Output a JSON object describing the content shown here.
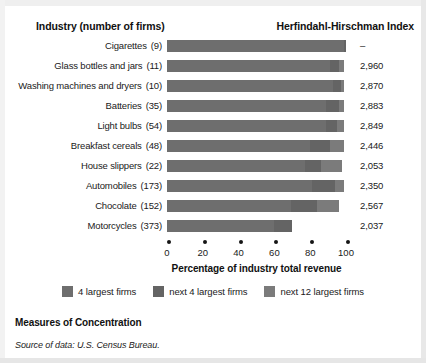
{
  "header": {
    "industry_label": "Industry (number of firms)",
    "hhi_label": "Herfindahl-Hirschman Index"
  },
  "footer": {
    "title": "Measures of Concentration",
    "source": "Source of data: U.S. Census Bureau."
  },
  "axis": {
    "title": "Percentage of industry total revenue",
    "ticks": [
      "0",
      "20",
      "40",
      "60",
      "80",
      "100"
    ]
  },
  "legend": [
    {
      "label": "4 largest firms",
      "color": "#6e6e6e"
    },
    {
      "label": "next 4 largest firms",
      "color": "#646464"
    },
    {
      "label": "next 12 largest firms",
      "color": "#7b7b7b"
    }
  ],
  "rows": [
    {
      "industry": "Cigarettes",
      "firms": "(9)",
      "hhi": "–"
    },
    {
      "industry": "Glass bottles and jars",
      "firms": "(11)",
      "hhi": "2,960"
    },
    {
      "industry": "Washing machines and dryers",
      "firms": "(10)",
      "hhi": "2,870"
    },
    {
      "industry": "Batteries",
      "firms": "(35)",
      "hhi": "2,883"
    },
    {
      "industry": "Light bulbs",
      "firms": "(54)",
      "hhi": "2,849"
    },
    {
      "industry": "Breakfast cereals",
      "firms": "(48)",
      "hhi": "2,446"
    },
    {
      "industry": "House slippers",
      "firms": "(22)",
      "hhi": "2,053"
    },
    {
      "industry": "Automobiles",
      "firms": "(173)",
      "hhi": "2,350"
    },
    {
      "industry": "Chocolate",
      "firms": "(152)",
      "hhi": "2,567"
    },
    {
      "industry": "Motorcycles",
      "firms": "(373)",
      "hhi": "2,037"
    }
  ],
  "chart_data": {
    "type": "bar",
    "orientation": "horizontal",
    "stacked": true,
    "title": "Measures of Concentration",
    "xlabel": "Percentage of industry total revenue",
    "ylabel": "Industry (number of firms)",
    "xlim": [
      0,
      100
    ],
    "xticks": [
      0,
      20,
      40,
      60,
      80,
      100
    ],
    "grid": false,
    "legend_position": "bottom-center",
    "categories": [
      "Cigarettes (9)",
      "Glass bottles and jars (11)",
      "Washing machines and dryers (10)",
      "Batteries (35)",
      "Light bulbs (54)",
      "Breakfast cereals (48)",
      "House slippers (22)",
      "Automobiles (173)",
      "Chocolate (152)",
      "Motorcycles (373)"
    ],
    "series": [
      {
        "name": "4 largest firms",
        "values": [
          99,
          91,
          93,
          89,
          89,
          80,
          77,
          81,
          69,
          60
        ]
      },
      {
        "name": "next 4 largest firms",
        "values": [
          1,
          5,
          4,
          7,
          6,
          11,
          9,
          13,
          15,
          10
        ]
      },
      {
        "name": "next 12 largest firms",
        "values": [
          0,
          3,
          2,
          3,
          4,
          8,
          12,
          5,
          12,
          0
        ]
      }
    ],
    "annotations": {
      "right_column_label": "Herfindahl-Hirschman Index",
      "right_column_values": [
        "–",
        "2,960",
        "2,870",
        "2,883",
        "2,849",
        "2,446",
        "2,053",
        "2,350",
        "2,567",
        "2,037"
      ]
    },
    "source": "Source of data: U.S. Census Bureau."
  }
}
